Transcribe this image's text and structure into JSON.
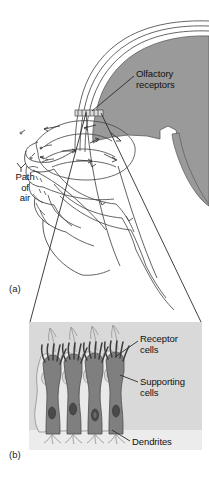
{
  "figure": {
    "panels": [
      {
        "tag": "(a)",
        "name": "sagittal-head-section",
        "labels": [
          {
            "name": "olfactory-receptors",
            "line1": "Olfactory",
            "line2": "receptors"
          },
          {
            "name": "path-of-air",
            "line1": "Path",
            "line2": "of",
            "line3": "air"
          }
        ]
      },
      {
        "tag": "(b)",
        "name": "olfactory-epithelium-detail",
        "labels": [
          {
            "name": "receptor-cells",
            "line1": "Receptor",
            "line2": "cells"
          },
          {
            "name": "supporting-cells",
            "line1": "Supporting",
            "line2": "cells"
          },
          {
            "name": "dendrites",
            "line1": "Dendrites"
          }
        ]
      }
    ]
  },
  "colors": {
    "background": "#ffffff",
    "brain_gray": "#9a9a9a",
    "tissue_light": "#f2f2f2",
    "panel_bg": "#d9d9d9",
    "panel_bg_bottom": "#eceaea",
    "receptor_cell": "#7f7f7f",
    "receptor_cell_dark": "#6a6a6a",
    "supporting_cell": "#e8e8e8",
    "nucleus_dark": "#4a4a4a",
    "outline": "#4a4a4a",
    "text": "#111111"
  }
}
